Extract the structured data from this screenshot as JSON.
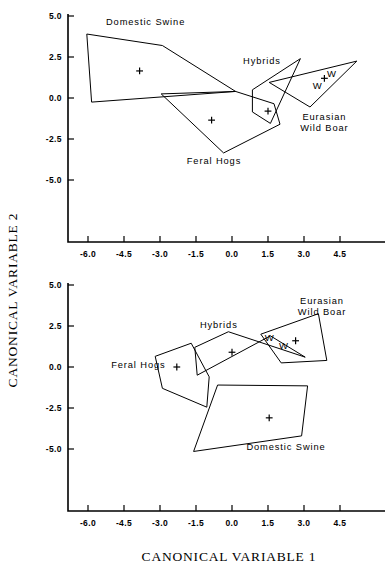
{
  "figure": {
    "xlabel": "CANONICAL VARIABLE 1",
    "ylabel": "CANONICAL VARIABLE 2"
  },
  "chart_data": {
    "type": "scatter",
    "title": "",
    "xlabel": "CANONICAL VARIABLE 1",
    "ylabel": "CANONICAL VARIABLE 2",
    "grid": false,
    "legend": "inline-annotations",
    "xlim": [
      -6.9,
      5.4
    ],
    "ylim": [
      -6.6,
      5.0
    ],
    "xticks": [
      "-6.0",
      "-4.5",
      "-3.0",
      "-1.5",
      "0.0",
      "1.5",
      "3.0",
      "4.5"
    ],
    "xtick_values": [
      -6.0,
      -4.5,
      -3.0,
      -1.5,
      0.0,
      1.5,
      3.0,
      4.5
    ],
    "yticks": [
      "5.0",
      "2.5",
      "0.0",
      "-2.5",
      "-5.0"
    ],
    "ytick_values": [
      5.0,
      2.5,
      0.0,
      -2.5,
      -5.0
    ],
    "panels": [
      {
        "name": "top-panel",
        "groups": [
          {
            "label": "Domestic Swine",
            "label_xy": [
              -3.6,
              4.45
            ],
            "centroid": [
              -3.85,
              1.65
            ],
            "hull": [
              [
                -6.05,
                3.9
              ],
              [
                -2.9,
                3.2
              ],
              [
                0.15,
                0.4
              ],
              [
                -5.85,
                -0.25
              ],
              [
                -6.05,
                3.9
              ]
            ]
          },
          {
            "label": "Feral Hogs",
            "label_xy": [
              -0.75,
              -4.05
            ],
            "centroid": [
              -0.85,
              -1.35
            ],
            "hull": [
              [
                -2.95,
                0.25
              ],
              [
                0.15,
                0.4
              ],
              [
                1.75,
                -0.35
              ],
              [
                2.0,
                -1.6
              ],
              [
                -0.35,
                -3.35
              ],
              [
                -2.95,
                0.25
              ]
            ]
          },
          {
            "label": "Hybrids",
            "label_xy": [
              1.25,
              2.05
            ],
            "centroid": [
              1.5,
              -0.8
            ],
            "hull": [
              [
                2.85,
                2.4
              ],
              [
                0.85,
                0.5
              ],
              [
                0.85,
                -0.85
              ],
              [
                1.6,
                -1.55
              ],
              [
                2.85,
                2.4
              ]
            ]
          },
          {
            "label": "Eurasian Wild Boar",
            "label_xy": [
              3.85,
              -1.35
            ],
            "centroid": [
              3.85,
              1.2
            ],
            "hull": [
              [
                5.2,
                2.25
              ],
              [
                1.55,
                0.95
              ],
              [
                3.25,
                -0.55
              ],
              [
                5.2,
                2.25
              ]
            ],
            "points": [
              {
                "label": "W",
                "xy": [
                  4.15,
                  1.45
                ]
              },
              {
                "label": "W",
                "xy": [
                  3.55,
                  0.7
                ]
              }
            ]
          }
        ]
      },
      {
        "name": "bottom-panel",
        "groups": [
          {
            "label": "Feral Hogs",
            "label_xy": [
              -3.9,
              -0.05
            ],
            "centroid": [
              -2.3,
              0.0
            ],
            "hull": [
              [
                -3.2,
                0.65
              ],
              [
                -1.7,
                1.45
              ],
              [
                -0.95,
                -0.6
              ],
              [
                -1.05,
                -2.45
              ],
              [
                -2.9,
                -1.3
              ],
              [
                -3.2,
                0.65
              ]
            ]
          },
          {
            "label": "Hybrids",
            "label_xy": [
              -0.55,
              2.35
            ],
            "centroid": [
              0.0,
              0.9
            ],
            "hull": [
              [
                -0.15,
                2.15
              ],
              [
                -1.55,
                1.2
              ],
              [
                -1.45,
                -0.5
              ],
              [
                1.6,
                1.9
              ],
              [
                3.05,
                0.6
              ],
              [
                -0.15,
                2.15
              ]
            ]
          },
          {
            "label": "Eurasian Wild Boar",
            "label_xy": [
              3.75,
              3.85
            ],
            "centroid": [
              2.65,
              1.6
            ],
            "hull": [
              [
                3.6,
                3.25
              ],
              [
                1.2,
                2.0
              ],
              [
                2.05,
                0.25
              ],
              [
                3.95,
                0.4
              ],
              [
                3.6,
                3.25
              ]
            ],
            "points": [
              {
                "label": "W",
                "xy": [
                  1.55,
                  1.75
                ]
              },
              {
                "label": "W",
                "xy": [
                  2.15,
                  1.25
                ]
              }
            ]
          },
          {
            "label": "Domestic Swine",
            "label_xy": [
              2.25,
              -5.05
            ],
            "centroid": [
              1.55,
              -3.1
            ],
            "hull": [
              [
                -0.6,
                -1.1
              ],
              [
                3.15,
                -1.15
              ],
              [
                2.9,
                -4.2
              ],
              [
                -1.6,
                -5.15
              ],
              [
                -0.6,
                -1.1
              ]
            ]
          }
        ]
      }
    ]
  }
}
